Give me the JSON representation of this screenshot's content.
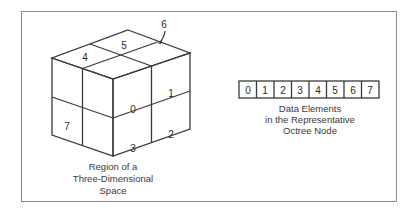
{
  "cube": {
    "octant_labels": {
      "o0": "0",
      "o1": "1",
      "o2": "2",
      "o3": "3",
      "o4": "4",
      "o5": "5",
      "o6": "6",
      "o7": "7"
    },
    "caption": [
      "Region of a",
      "Three-Dimensional",
      "Space"
    ]
  },
  "node": {
    "cells": [
      "0",
      "1",
      "2",
      "3",
      "4",
      "5",
      "6",
      "7"
    ],
    "caption": [
      "Data Elements",
      "in the Representative",
      "Octree Node"
    ]
  }
}
